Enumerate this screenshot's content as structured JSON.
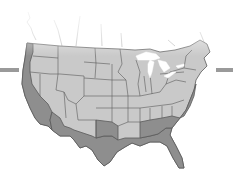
{
  "map": {
    "title": "",
    "region": "Continental United States",
    "colors": {
      "background": "#ffffff",
      "land": "#c9c9c9",
      "highlight": "#8e8e8e",
      "border": "#5a5a5a",
      "lakes": "#ffffff",
      "side_bars": "#9a9a9a"
    },
    "highlighted_zone": [
      "Washington coast",
      "Oregon coast",
      "California",
      "Arizona border",
      "New Mexico border",
      "Texas",
      "Louisiana",
      "Mississippi",
      "Alabama",
      "Georgia",
      "Florida",
      "South Carolina",
      "Atlantic coast"
    ],
    "side_bars": [
      {
        "position": "left"
      },
      {
        "position": "right"
      }
    ]
  }
}
